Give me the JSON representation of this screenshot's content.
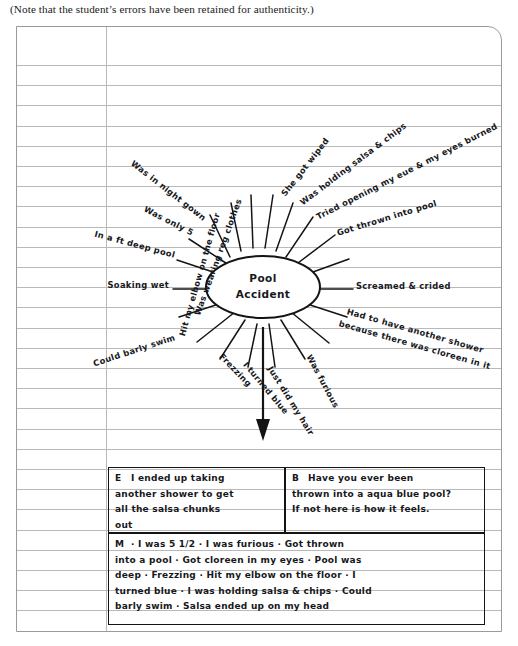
{
  "caption": "(Note that the student’s errors have been retained for authenticity.)",
  "page": {
    "type": "ruled-notebook-sheet",
    "ruled_line_color": "#b9b9b9",
    "ink_color": "#16181c",
    "margin_line_x": 105
  },
  "cluster_map": {
    "center_line1": "Pool",
    "center_line2": "Accident",
    "spokes": [
      {
        "id": "spoke-1",
        "text": "Hit my elbow on the floor",
        "angle": -74
      },
      {
        "id": "spoke-2",
        "text": "Was wearing reg clothes",
        "angle": -70
      },
      {
        "id": "spoke-3",
        "text": "She got wiped",
        "angle": -52
      },
      {
        "id": "spoke-4",
        "text": "Was holding salsa & chips",
        "angle": -37
      },
      {
        "id": "spoke-5",
        "text": "Tried opening my eue & my eyes burned",
        "angle": -27
      },
      {
        "id": "spoke-6",
        "text": "Got thrown into pool",
        "angle": -17
      },
      {
        "id": "spoke-7",
        "text": "Screamed & crided",
        "angle": 0
      },
      {
        "id": "spoke-8",
        "text": "Had to have another shower",
        "angle": 16
      },
      {
        "id": "spoke-9",
        "text": "because there was cloreen in it",
        "angle": 16
      },
      {
        "id": "spoke-10",
        "text": "Was furious",
        "angle": 62
      },
      {
        "id": "spoke-11",
        "text": "Just did my hair",
        "angle": 58
      },
      {
        "id": "spoke-12",
        "text": "I turned blue",
        "angle": 50
      },
      {
        "id": "spoke-13",
        "text": "Frezzing",
        "angle": 46
      },
      {
        "id": "spoke-14",
        "text": "Could barly swim",
        "angle": -18
      },
      {
        "id": "spoke-15",
        "text": "Soaking wet",
        "angle": 0
      },
      {
        "id": "spoke-16",
        "text": "In a  ft deep pool",
        "angle": 15
      },
      {
        "id": "spoke-17",
        "text": "Was only 5",
        "angle": 27
      },
      {
        "id": "spoke-18",
        "text": "Was in night gown",
        "angle": 38
      }
    ]
  },
  "boxes": {
    "ending": {
      "tag": "E",
      "lines": [
        "I ended up taking",
        "another shower to get",
        "all the salsa chunks",
        "out"
      ]
    },
    "beginning": {
      "tag": "B",
      "lines": [
        "Have you ever been",
        "thrown into a aqua blue pool?",
        "If not here is how it feels."
      ]
    },
    "middle": {
      "tag": "M",
      "lines": [
        "·  I was 5 1/2    ·  I was furious  ·  Got thrown",
        "into a pool  ·  Got cloreen in my eyes  ·  Pool was",
        "deep  ·  Frezzing  ·  Hit my elbow on the floor  ·  I",
        "turned blue  ·  I was holding salsa & chips  ·  Could",
        "barly swim  ·  Salsa ended up on my head"
      ]
    }
  }
}
